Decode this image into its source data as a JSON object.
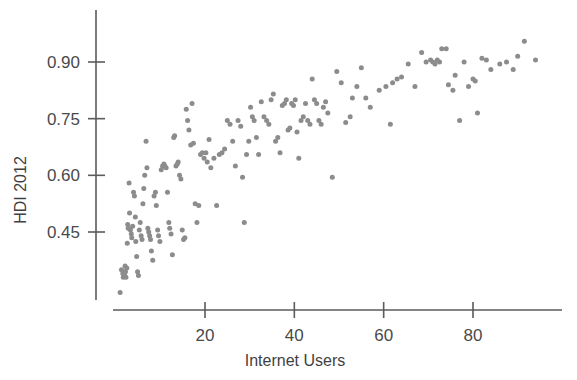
{
  "chart_data": {
    "type": "scatter",
    "title": "",
    "xlabel": "Internet Users",
    "ylabel": "HDI 2012",
    "xlim": [
      0,
      100
    ],
    "ylim": [
      0.27,
      1.0
    ],
    "xticks": [
      20,
      40,
      60,
      80
    ],
    "yticks": [
      0.45,
      0.6,
      0.75,
      0.9
    ],
    "xtick_labels": [
      "20",
      "40",
      "60",
      "80"
    ],
    "ytick_labels": [
      "0.45",
      "0.60",
      "0.75",
      "0.90"
    ],
    "grid": false,
    "legend": "none",
    "marker": {
      "shape": "circle",
      "color": "#8c8c8c",
      "size_px": 5
    },
    "n_points": 173,
    "points": [
      [
        1.0,
        0.29
      ],
      [
        1.3,
        0.35
      ],
      [
        1.6,
        0.34
      ],
      [
        1.7,
        0.33
      ],
      [
        1.9,
        0.345
      ],
      [
        2.0,
        0.335
      ],
      [
        2.1,
        0.36
      ],
      [
        2.2,
        0.345
      ],
      [
        2.3,
        0.33
      ],
      [
        2.5,
        0.355
      ],
      [
        2.6,
        0.42
      ],
      [
        2.7,
        0.47
      ],
      [
        2.8,
        0.46
      ],
      [
        3.0,
        0.58
      ],
      [
        3.1,
        0.5
      ],
      [
        3.3,
        0.455
      ],
      [
        3.5,
        0.445
      ],
      [
        3.6,
        0.435
      ],
      [
        3.8,
        0.465
      ],
      [
        4.0,
        0.555
      ],
      [
        4.2,
        0.545
      ],
      [
        4.4,
        0.49
      ],
      [
        4.5,
        0.425
      ],
      [
        4.7,
        0.385
      ],
      [
        4.9,
        0.345
      ],
      [
        5.1,
        0.335
      ],
      [
        5.3,
        0.455
      ],
      [
        5.5,
        0.475
      ],
      [
        5.7,
        0.44
      ],
      [
        5.9,
        0.43
      ],
      [
        6.1,
        0.525
      ],
      [
        6.3,
        0.565
      ],
      [
        6.5,
        0.6
      ],
      [
        6.8,
        0.69
      ],
      [
        7.0,
        0.62
      ],
      [
        7.2,
        0.46
      ],
      [
        7.4,
        0.45
      ],
      [
        7.6,
        0.44
      ],
      [
        7.8,
        0.43
      ],
      [
        8.0,
        0.4
      ],
      [
        8.3,
        0.375
      ],
      [
        8.6,
        0.545
      ],
      [
        8.9,
        0.555
      ],
      [
        9.1,
        0.52
      ],
      [
        9.4,
        0.455
      ],
      [
        9.6,
        0.44
      ],
      [
        9.9,
        0.425
      ],
      [
        10.2,
        0.615
      ],
      [
        10.5,
        0.625
      ],
      [
        10.8,
        0.63
      ],
      [
        11.0,
        0.625
      ],
      [
        11.3,
        0.62
      ],
      [
        11.6,
        0.555
      ],
      [
        11.9,
        0.475
      ],
      [
        12.1,
        0.46
      ],
      [
        12.4,
        0.445
      ],
      [
        12.7,
        0.39
      ],
      [
        13.0,
        0.7
      ],
      [
        13.2,
        0.705
      ],
      [
        13.5,
        0.625
      ],
      [
        13.8,
        0.63
      ],
      [
        14.0,
        0.635
      ],
      [
        14.3,
        0.6
      ],
      [
        14.6,
        0.59
      ],
      [
        14.9,
        0.455
      ],
      [
        15.2,
        0.43
      ],
      [
        15.5,
        0.435
      ],
      [
        15.8,
        0.775
      ],
      [
        16.1,
        0.745
      ],
      [
        16.4,
        0.72
      ],
      [
        16.8,
        0.68
      ],
      [
        17.1,
        0.79
      ],
      [
        17.4,
        0.685
      ],
      [
        17.8,
        0.525
      ],
      [
        18.2,
        0.475
      ],
      [
        18.6,
        0.52
      ],
      [
        19.0,
        0.655
      ],
      [
        19.4,
        0.66
      ],
      [
        19.8,
        0.645
      ],
      [
        20.2,
        0.66
      ],
      [
        20.5,
        0.635
      ],
      [
        20.9,
        0.695
      ],
      [
        21.3,
        0.62
      ],
      [
        22.0,
        0.645
      ],
      [
        22.6,
        0.52
      ],
      [
        23.2,
        0.655
      ],
      [
        23.8,
        0.66
      ],
      [
        24.4,
        0.67
      ],
      [
        25.0,
        0.745
      ],
      [
        25.6,
        0.735
      ],
      [
        26.2,
        0.69
      ],
      [
        26.8,
        0.625
      ],
      [
        27.4,
        0.745
      ],
      [
        28.0,
        0.73
      ],
      [
        28.4,
        0.595
      ],
      [
        28.8,
        0.475
      ],
      [
        29.3,
        0.655
      ],
      [
        29.8,
        0.69
      ],
      [
        30.2,
        0.78
      ],
      [
        30.6,
        0.755
      ],
      [
        31.0,
        0.745
      ],
      [
        31.5,
        0.7
      ],
      [
        32.0,
        0.655
      ],
      [
        32.6,
        0.795
      ],
      [
        33.2,
        0.755
      ],
      [
        33.8,
        0.745
      ],
      [
        34.3,
        0.735
      ],
      [
        34.8,
        0.8
      ],
      [
        35.3,
        0.815
      ],
      [
        35.8,
        0.69
      ],
      [
        36.3,
        0.7
      ],
      [
        36.8,
        0.66
      ],
      [
        37.3,
        0.785
      ],
      [
        37.8,
        0.79
      ],
      [
        38.2,
        0.8
      ],
      [
        38.6,
        0.72
      ],
      [
        39.0,
        0.725
      ],
      [
        39.4,
        0.79
      ],
      [
        39.8,
        0.785
      ],
      [
        40.2,
        0.8
      ],
      [
        40.6,
        0.715
      ],
      [
        41.0,
        0.645
      ],
      [
        41.5,
        0.745
      ],
      [
        42.0,
        0.755
      ],
      [
        42.5,
        0.79
      ],
      [
        43.0,
        0.745
      ],
      [
        43.5,
        0.735
      ],
      [
        44.0,
        0.855
      ],
      [
        44.5,
        0.8
      ],
      [
        45.0,
        0.79
      ],
      [
        45.5,
        0.745
      ],
      [
        46.0,
        0.735
      ],
      [
        46.5,
        0.78
      ],
      [
        47.0,
        0.795
      ],
      [
        47.5,
        0.765
      ],
      [
        48.5,
        0.595
      ],
      [
        49.5,
        0.875
      ],
      [
        50.5,
        0.845
      ],
      [
        51.5,
        0.74
      ],
      [
        52.5,
        0.755
      ],
      [
        53.0,
        0.805
      ],
      [
        54.0,
        0.835
      ],
      [
        55.0,
        0.885
      ],
      [
        56.0,
        0.805
      ],
      [
        57.0,
        0.78
      ],
      [
        59.0,
        0.825
      ],
      [
        60.5,
        0.835
      ],
      [
        61.5,
        0.735
      ],
      [
        62.0,
        0.845
      ],
      [
        63.0,
        0.855
      ],
      [
        64.0,
        0.86
      ],
      [
        65.5,
        0.895
      ],
      [
        67.0,
        0.835
      ],
      [
        68.5,
        0.925
      ],
      [
        69.5,
        0.9
      ],
      [
        70.5,
        0.905
      ],
      [
        71.0,
        0.9
      ],
      [
        71.5,
        0.895
      ],
      [
        72.0,
        0.905
      ],
      [
        72.5,
        0.9
      ],
      [
        73.0,
        0.935
      ],
      [
        74.0,
        0.935
      ],
      [
        74.5,
        0.84
      ],
      [
        75.5,
        0.825
      ],
      [
        76.0,
        0.865
      ],
      [
        77.0,
        0.745
      ],
      [
        78.0,
        0.9
      ],
      [
        79.0,
        0.835
      ],
      [
        80.0,
        0.855
      ],
      [
        80.5,
        0.85
      ],
      [
        81.0,
        0.765
      ],
      [
        82.0,
        0.91
      ],
      [
        83.0,
        0.905
      ],
      [
        84.0,
        0.88
      ],
      [
        86.0,
        0.895
      ],
      [
        87.5,
        0.9
      ],
      [
        89.0,
        0.88
      ],
      [
        90.0,
        0.915
      ],
      [
        91.5,
        0.955
      ],
      [
        94.0,
        0.905
      ]
    ]
  },
  "axes": {
    "y_axis_title": "HDI 2012",
    "x_axis_title": "Internet Users"
  }
}
